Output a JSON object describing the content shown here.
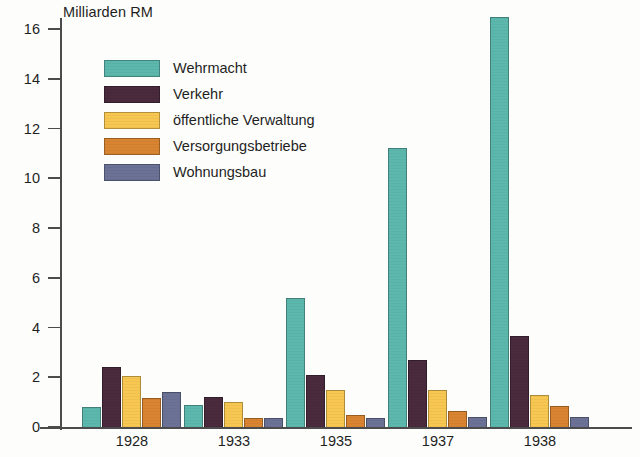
{
  "chart_data": {
    "type": "bar",
    "title": "",
    "ylabel": "Milliarden RM",
    "xlabel": "",
    "categories": [
      "1928",
      "1933",
      "1935",
      "1937",
      "1938"
    ],
    "ylim": [
      0,
      17
    ],
    "yticks": [
      0,
      2,
      4,
      6,
      8,
      10,
      12,
      14,
      16
    ],
    "ytick_labels": [
      "0",
      "2",
      "4",
      "6",
      "8",
      "10",
      "12",
      "14",
      "16"
    ],
    "grid": false,
    "legend_position": "upper-left-inside",
    "series": [
      {
        "name": "Wehrmacht",
        "color": "#5cb8ad",
        "values": [
          0.8,
          0.9,
          5.2,
          11.2,
          16.5
        ]
      },
      {
        "name": "Verkehr",
        "color": "#4a2a3d",
        "values": [
          2.4,
          1.2,
          2.1,
          2.7,
          3.65
        ]
      },
      {
        "name": "öffentliche Verwaltung",
        "color": "#f7c752",
        "values": [
          2.05,
          1.0,
          1.5,
          1.5,
          1.3
        ]
      },
      {
        "name": "Versorgungsbetriebe",
        "color": "#d98431",
        "values": [
          1.15,
          0.35,
          0.5,
          0.65,
          0.85
        ]
      },
      {
        "name": "Wohnungsbau",
        "color": "#6b7296",
        "values": [
          1.4,
          0.35,
          0.35,
          0.4,
          0.4
        ]
      }
    ]
  },
  "axis": {
    "y_title": "Milliarden RM"
  }
}
